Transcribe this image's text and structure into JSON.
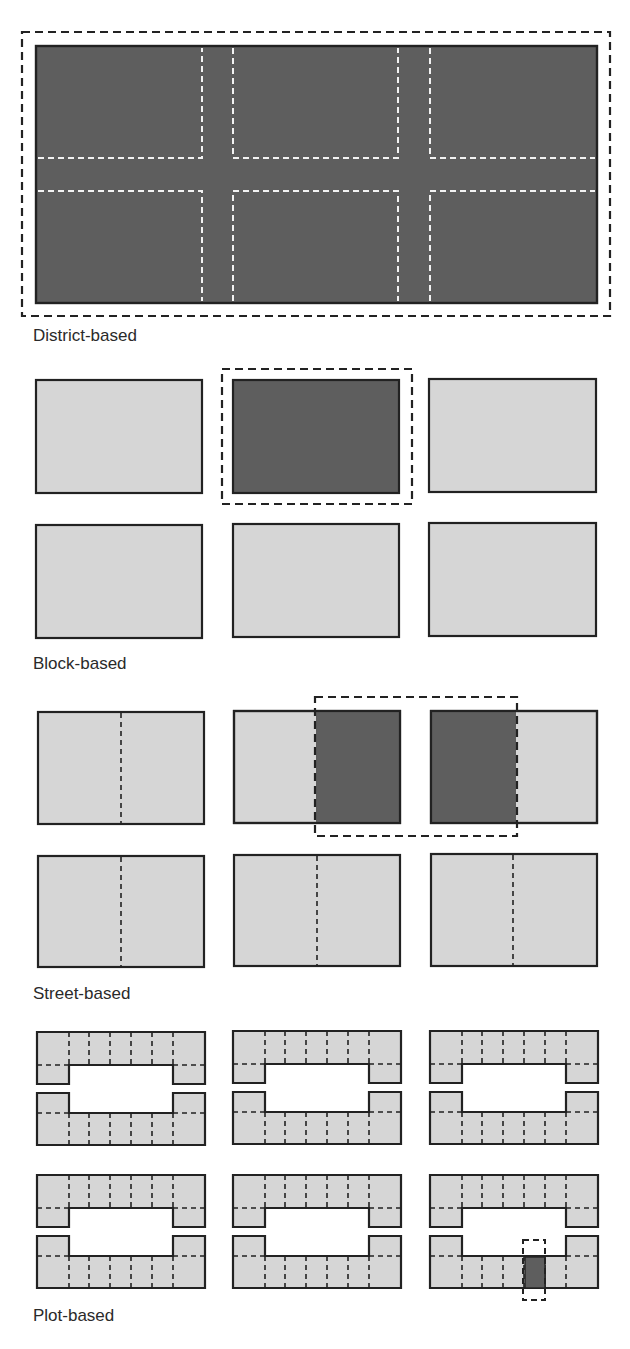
{
  "colors": {
    "dark_fill": "#5e5e5e",
    "light_fill": "#d6d6d6",
    "outline": "#222222",
    "white_dash": "#f2f2f2",
    "background": "#ffffff"
  },
  "sections": [
    {
      "id": "district",
      "label": "District-based",
      "highlight": "entire district (all blocks and streets)"
    },
    {
      "id": "block",
      "label": "Block-based",
      "highlight": "single block (top middle)"
    },
    {
      "id": "street",
      "label": "Street-based",
      "highlight": "facing half-blocks across one street (top row, middle street)"
    },
    {
      "id": "plot",
      "label": "Plot-based",
      "highlight": "single plot (bottom-right block, lower row)"
    }
  ]
}
